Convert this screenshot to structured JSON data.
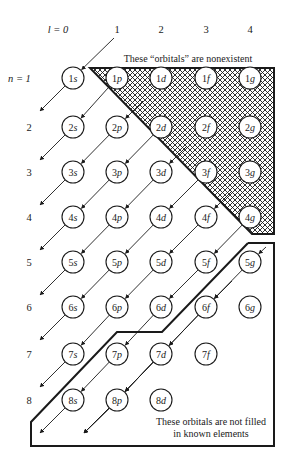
{
  "column_header": {
    "prefix": "l = 0",
    "labels": [
      "1",
      "2",
      "3",
      "4"
    ]
  },
  "row_header": {
    "first": "n = 1",
    "labels": [
      "2",
      "3",
      "4",
      "5",
      "6",
      "7",
      "8"
    ]
  },
  "annotations": {
    "nonexistent": "These “orbitals” are nonexistent",
    "not_filled_line1": "These orbitals are not filled",
    "not_filled_line2": "in known elements"
  },
  "orbitals": [
    [
      "1s",
      "1p",
      "1d",
      "1f",
      "1g"
    ],
    [
      "2s",
      "2p",
      "2d",
      "2f",
      "2g"
    ],
    [
      "3s",
      "3p",
      "3d",
      "3f",
      "3g"
    ],
    [
      "4s",
      "4p",
      "4d",
      "4f",
      "4g"
    ],
    [
      "5s",
      "5p",
      "5d",
      "5f",
      "5g"
    ],
    [
      "6s",
      "6p",
      "6d",
      "6f",
      "6g"
    ],
    [
      "7s",
      "7p",
      "7d",
      "7f"
    ],
    [
      "8s",
      "8p",
      "8d"
    ]
  ],
  "colors": {
    "ink": "#1a1a1a",
    "background": "#ffffff"
  }
}
